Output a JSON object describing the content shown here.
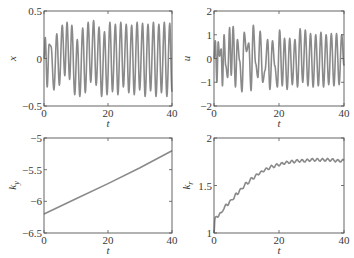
{
  "figure": {
    "panel_count": 4,
    "line_color": "#8a8a8a",
    "axis_color": "#555555"
  },
  "chart_data": [
    {
      "id": "x",
      "type": "line",
      "title": "",
      "xlabel": "t",
      "ylabel": "x",
      "xlim": [
        0,
        40
      ],
      "ylim": [
        -0.5,
        0.5
      ],
      "xticks": [
        0,
        20,
        40
      ],
      "xtick_labels": [
        "0",
        "20",
        "40"
      ],
      "yticks": [
        -0.5,
        0,
        0.5
      ],
      "ytick_labels": [
        "−0.5",
        "0",
        "0.5"
      ],
      "grid": false,
      "legend": null,
      "box": {
        "left": 44,
        "top": 11,
        "right": 172,
        "bottom": 106
      },
      "series": [
        {
          "name": "x(t)",
          "description": "oscillating state, amplitude growing from ~0.2 to ~0.4 with period ~1.8",
          "x": [
            0,
            0.4,
            1.0,
            1.6,
            2.2,
            3.1,
            4.0,
            4.8,
            5.7,
            6.5,
            7.2,
            8.0,
            8.7,
            9.6,
            10.4,
            11.2,
            12.1,
            12.9,
            13.8,
            14.6,
            15.5,
            16.3,
            17.2,
            18.0,
            18.9,
            19.7,
            20.6,
            21.4,
            22.3,
            23.1,
            24.0,
            24.8,
            25.7,
            26.5,
            27.4,
            28.2,
            29.1,
            29.9,
            30.8,
            31.6,
            32.5,
            33.3,
            34.2,
            35.0,
            35.9,
            36.7,
            37.6,
            38.4,
            39.3,
            40.0
          ],
          "y": [
            0.0,
            0.22,
            -0.3,
            0.15,
            0.13,
            -0.33,
            0.26,
            -0.28,
            0.35,
            -0.18,
            0.38,
            -0.22,
            0.35,
            -0.38,
            0.2,
            -0.4,
            0.32,
            -0.36,
            0.38,
            -0.25,
            0.4,
            -0.28,
            0.33,
            -0.4,
            0.28,
            -0.38,
            0.38,
            -0.35,
            0.36,
            -0.38,
            0.38,
            -0.3,
            0.36,
            -0.36,
            0.35,
            -0.38,
            0.38,
            -0.33,
            0.37,
            -0.4,
            0.36,
            -0.34,
            0.38,
            -0.4,
            0.36,
            -0.36,
            0.38,
            -0.4,
            0.37,
            -0.35
          ]
        }
      ]
    },
    {
      "id": "u",
      "type": "line",
      "title": "",
      "xlabel": "t",
      "ylabel": "u",
      "xlim": [
        0,
        40
      ],
      "ylim": [
        -2,
        2
      ],
      "xticks": [
        0,
        20,
        40
      ],
      "xtick_labels": [
        "0",
        "20",
        "40"
      ],
      "yticks": [
        -2,
        -1,
        0,
        1,
        2
      ],
      "ytick_labels": [
        "−2",
        "−1",
        "0",
        "1",
        "2"
      ],
      "grid": false,
      "legend": null,
      "box": {
        "left": 214,
        "top": 11,
        "right": 344,
        "bottom": 106
      },
      "series": [
        {
          "name": "u(t)",
          "description": "control input oscillating between roughly -1.4 and 1.4",
          "x": [
            0,
            0.4,
            0.9,
            1.3,
            1.7,
            2.2,
            2.6,
            3.1,
            3.6,
            4.2,
            4.8,
            5.3,
            5.9,
            6.6,
            7.2,
            7.9,
            8.6,
            9.3,
            10.0,
            10.7,
            11.4,
            12.1,
            12.8,
            13.5,
            14.2,
            15.0,
            15.7,
            16.5,
            17.2,
            18.0,
            18.7,
            19.5,
            20.2,
            21.0,
            21.7,
            22.5,
            23.3,
            24.1,
            24.9,
            25.7,
            26.5,
            27.3,
            28.1,
            28.9,
            29.7,
            30.5,
            31.3,
            32.1,
            32.9,
            33.7,
            34.5,
            35.3,
            36.1,
            36.9,
            37.7,
            38.5,
            39.3,
            40.0
          ],
          "y": [
            0.0,
            0.75,
            -1.0,
            0.7,
            0.1,
            0.4,
            -1.15,
            1.0,
            -0.3,
            -0.8,
            1.3,
            -0.7,
            1.35,
            -1.2,
            0.8,
            -0.1,
            -1.4,
            1.1,
            0.3,
            0.65,
            -1.35,
            1.4,
            -0.2,
            -0.8,
            1.15,
            -1.0,
            -0.5,
            0.8,
            -1.3,
            0.75,
            -0.3,
            -1.2,
            1.2,
            -1.15,
            0.85,
            -1.3,
            0.85,
            -1.1,
            0.8,
            -1.2,
            1.25,
            -1.0,
            1.2,
            -1.15,
            1.05,
            -1.2,
            1.0,
            -1.15,
            1.1,
            -1.2,
            1.0,
            -1.1,
            1.05,
            -1.15,
            1.05,
            -1.1,
            1.0,
            -0.3
          ]
        }
      ]
    },
    {
      "id": "ky",
      "type": "line",
      "title": "",
      "xlabel": "t",
      "ylabel": "k_y",
      "xlim": [
        0,
        40
      ],
      "ylim": [
        -6.5,
        -5
      ],
      "xticks": [
        0,
        20,
        40
      ],
      "xtick_labels": [
        "0",
        "20",
        "40"
      ],
      "yticks": [
        -6.5,
        -6,
        -5.5,
        -5
      ],
      "ytick_labels": [
        "−6.5",
        "−6",
        "−5.5",
        "−5"
      ],
      "grid": false,
      "legend": null,
      "box": {
        "left": 44,
        "top": 138,
        "right": 172,
        "bottom": 233
      },
      "series": [
        {
          "name": "k_y(t)",
          "description": "adaptive gain increasing nearly linearly",
          "x": [
            0,
            10,
            20,
            30,
            40
          ],
          "y": [
            -6.2,
            -5.96,
            -5.72,
            -5.47,
            -5.2
          ]
        }
      ]
    },
    {
      "id": "kr",
      "type": "line",
      "title": "",
      "xlabel": "t",
      "ylabel": "k_r",
      "xlim": [
        0,
        40
      ],
      "ylim": [
        1,
        2
      ],
      "xticks": [
        0,
        20,
        40
      ],
      "xtick_labels": [
        "0",
        "20",
        "40"
      ],
      "yticks": [
        1,
        1.5,
        2
      ],
      "ytick_labels": [
        "1",
        "1.5",
        "2"
      ],
      "grid": false,
      "legend": null,
      "box": {
        "left": 214,
        "top": 138,
        "right": 344,
        "bottom": 233
      },
      "series": [
        {
          "name": "k_r(t)",
          "description": "adaptive gain rising from 1 and saturating near 1.76 with small ripple",
          "x": [
            0,
            0.3,
            1,
            2,
            3,
            4,
            5,
            6,
            7,
            8,
            10,
            12,
            14,
            16,
            18,
            20,
            22,
            24,
            26,
            28,
            30,
            32,
            34,
            36,
            38,
            40
          ],
          "y": [
            1.0,
            1.15,
            1.18,
            1.2,
            1.26,
            1.3,
            1.33,
            1.37,
            1.41,
            1.45,
            1.52,
            1.58,
            1.63,
            1.67,
            1.7,
            1.72,
            1.74,
            1.75,
            1.76,
            1.76,
            1.77,
            1.77,
            1.77,
            1.77,
            1.76,
            1.76
          ]
        }
      ]
    }
  ]
}
